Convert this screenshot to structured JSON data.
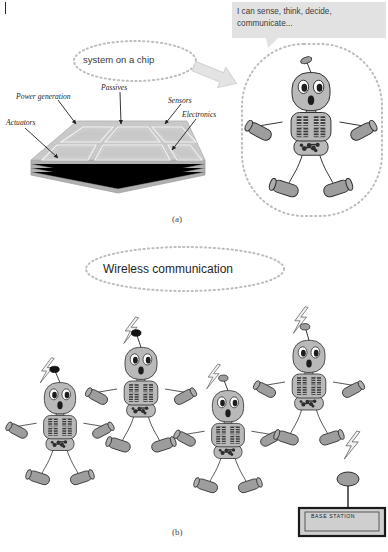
{
  "figure": {
    "panel_a": {
      "caption": "(a)",
      "soc_bubble": "system on a chip",
      "speech_bubble": "I can sense, think, decide, communicate...",
      "chip_labels": [
        {
          "key": "power",
          "text": "Power generation"
        },
        {
          "key": "passives",
          "text": "Passives"
        },
        {
          "key": "sensors",
          "text": "Sensors"
        },
        {
          "key": "electronics",
          "text": "Electronics"
        },
        {
          "key": "actuators",
          "text": "Actuators"
        }
      ],
      "arrow": "block-arrow-right-down",
      "robot_count": 1
    },
    "panel_b": {
      "caption": "(b)",
      "title_bubble": "Wireless communication",
      "base_station_label": "BASE STATION",
      "robot_count": 4,
      "antenna_types": [
        "black-ball",
        "black-ball",
        "gray-oval",
        "gray-oval"
      ]
    }
  },
  "colors": {
    "body_fill": "#b9b9b9",
    "body_stroke": "#2b2b2b",
    "limb_fill": "#9d9d9d",
    "chip_dark": "#3a3a3a",
    "chip_slab": "#c9c9c9",
    "chip_slab_side": "#b0b0b0",
    "bubble_dot": "#bdbdbd",
    "speech_fill": "#e2e2e2",
    "arrow_fill": "#e0e0e0",
    "base_station_fill": "#cfcfcf",
    "page_bg": "#ffffff"
  }
}
